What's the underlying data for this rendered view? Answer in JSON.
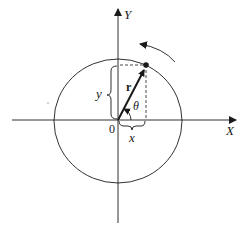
{
  "diagram": {
    "type": "polar-vector-on-circle",
    "labels": {
      "y_axis": "Y",
      "x_axis": "X",
      "origin": "0",
      "x_component": "x",
      "y_component": "y",
      "vector": "r",
      "angle": "θ"
    },
    "colors": {
      "ink": "#1a1a1a",
      "background": "#ffffff"
    },
    "elements": [
      "x-axis with arrow",
      "y-axis with arrow",
      "circle centered at origin",
      "radius vector r to point on circle",
      "dashed projection lines",
      "brace for x component",
      "brace for y component",
      "angle arc theta",
      "counterclockwise rotation arrow"
    ]
  }
}
